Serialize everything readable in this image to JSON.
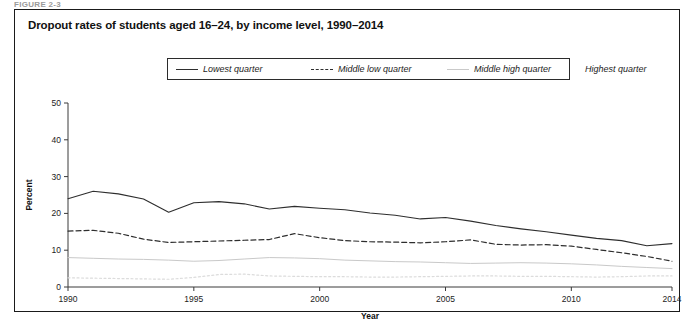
{
  "figure": {
    "tag": "FIGURE 2-3",
    "title": "Dropout rates of students aged 16–24, by income level, 1990–2014"
  },
  "legend": {
    "items": [
      {
        "label": "Lowest quarter",
        "style": "solid-dark",
        "color": "#2e2e2e"
      },
      {
        "label": "Middle low quarter",
        "style": "dashed",
        "color": "#2e2e2e"
      },
      {
        "label": "Middle high quarter",
        "style": "solid-light",
        "color": "#c9c9c9"
      },
      {
        "label": "Highest quarter",
        "style": "dotted-light",
        "color": "#dcdcdc"
      }
    ]
  },
  "chart_data": {
    "type": "line",
    "title": "Dropout rates of students aged 16–24, by income level, 1990–2014",
    "xlabel": "Year",
    "ylabel": "Percent",
    "xlim": [
      1990,
      2014
    ],
    "ylim": [
      0,
      50
    ],
    "ytick_values": [
      0,
      10,
      20,
      30,
      40,
      50
    ],
    "ytick_labels": [
      "0",
      "10",
      "20",
      "30",
      "40",
      "50"
    ],
    "xtick_values": [
      1990,
      1995,
      2000,
      2005,
      2010,
      2014
    ],
    "xtick_labels": [
      "1990",
      "1995",
      "2000",
      "2005",
      "2010",
      "2014"
    ],
    "grid": false,
    "legend_position": "top-center",
    "x": [
      1990,
      1991,
      1992,
      1993,
      1994,
      1995,
      1996,
      1997,
      1998,
      1999,
      2000,
      2001,
      2002,
      2003,
      2004,
      2005,
      2006,
      2007,
      2008,
      2009,
      2010,
      2011,
      2012,
      2013,
      2014
    ],
    "series": [
      {
        "name": "Lowest quarter",
        "style": "solid-dark",
        "color": "#2e2e2e",
        "values": [
          24.0,
          26.0,
          25.3,
          23.9,
          20.3,
          22.9,
          23.2,
          22.6,
          21.2,
          21.9,
          21.4,
          21.0,
          20.1,
          19.5,
          18.5,
          18.9,
          17.9,
          16.7,
          15.8,
          15.0,
          14.1,
          13.2,
          12.6,
          11.2,
          11.8
        ]
      },
      {
        "name": "Middle low quarter",
        "style": "dashed",
        "color": "#2e2e2e",
        "values": [
          15.2,
          15.4,
          14.6,
          13.0,
          12.1,
          12.3,
          12.5,
          12.7,
          12.9,
          14.5,
          13.4,
          12.6,
          12.3,
          12.2,
          12.0,
          12.3,
          12.8,
          11.6,
          11.4,
          11.5,
          11.1,
          10.2,
          9.3,
          8.3,
          7.0
        ]
      },
      {
        "name": "Middle high quarter",
        "style": "solid-light",
        "color": "#c9c9c9",
        "values": [
          8.0,
          7.8,
          7.6,
          7.5,
          7.3,
          7.0,
          7.2,
          7.6,
          8.0,
          7.9,
          7.7,
          7.3,
          7.1,
          6.9,
          6.8,
          6.6,
          6.4,
          6.5,
          6.6,
          6.5,
          6.3,
          6.0,
          5.6,
          5.3,
          5.0
        ]
      },
      {
        "name": "Highest quarter",
        "style": "dotted-light",
        "color": "#dcdcdc",
        "values": [
          2.5,
          2.4,
          2.3,
          2.2,
          2.1,
          2.6,
          3.4,
          3.5,
          3.0,
          2.9,
          2.8,
          2.8,
          2.7,
          2.7,
          2.8,
          2.9,
          3.0,
          3.0,
          2.9,
          2.9,
          2.8,
          2.7,
          2.8,
          3.0,
          3.0
        ]
      }
    ]
  }
}
